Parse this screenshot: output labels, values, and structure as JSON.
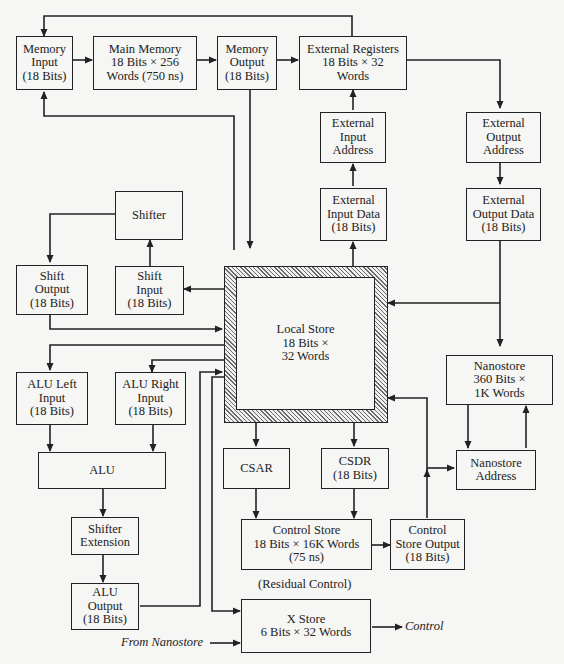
{
  "diagram": {
    "nodes": {
      "memory_input": [
        "Memory",
        "Input",
        "(18 Bits)"
      ],
      "main_memory": [
        "Main Memory",
        "18 Bits × 256",
        "Words (750 ns)"
      ],
      "memory_output": [
        "Memory",
        "Output",
        "(18 Bits)"
      ],
      "external_registers": [
        "External Registers",
        "18 Bits × 32",
        "Words"
      ],
      "external_input_address": [
        "External",
        "Input",
        "Address"
      ],
      "external_output_address": [
        "External",
        "Output",
        "Address"
      ],
      "external_input_data": [
        "External",
        "Input Data",
        "(18 Bits)"
      ],
      "external_output_data": [
        "External",
        "Output Data",
        "(18 Bits)"
      ],
      "shifter": [
        "Shifter"
      ],
      "shift_output": [
        "Shift",
        "Output",
        "(18 Bits)"
      ],
      "shift_input": [
        "Shift",
        "Input",
        "(18 Bits)"
      ],
      "local_store": [
        "Local Store",
        "18 Bits ×",
        "32 Words"
      ],
      "nanostore": [
        "Nanostore",
        "360 Bits ×",
        "1K Words"
      ],
      "nanostore_address": [
        "Nanostore",
        "Address"
      ],
      "alu_left_input": [
        "ALU Left",
        "Input",
        "(18 Bits)"
      ],
      "alu_right_input": [
        "ALU Right",
        "Input",
        "(18 Bits)"
      ],
      "alu": [
        "ALU"
      ],
      "csar": [
        "CSAR"
      ],
      "csdr": [
        "CSDR",
        "(18 Bits)"
      ],
      "shifter_extension": [
        "Shifter",
        "Extension"
      ],
      "control_store": [
        "Control Store",
        "18 Bits × 16K Words",
        "(75 ns)"
      ],
      "control_store_output": [
        "Control",
        "Store Output",
        "(18 Bits)"
      ],
      "alu_output": [
        "ALU",
        "Output",
        "(18 Bits)"
      ],
      "x_store": [
        "X Store",
        "6 Bits × 32 Words"
      ]
    },
    "labels": {
      "residual_control": "(Residual Control)",
      "from_nanostore": "From Nanostore",
      "control": "Control"
    },
    "edges": [
      [
        "memory_input",
        "main_memory"
      ],
      [
        "main_memory",
        "memory_output"
      ],
      [
        "memory_output",
        "external_registers"
      ],
      [
        "external_registers",
        "memory_input"
      ],
      [
        "memory_output",
        "local_store"
      ],
      [
        "local_store",
        "memory_input"
      ],
      [
        "external_registers",
        "external_output_address"
      ],
      [
        "external_output_address",
        "external_output_data"
      ],
      [
        "external_output_data",
        "local_store"
      ],
      [
        "external_output_data",
        "nanostore"
      ],
      [
        "external_input_address",
        "external_registers"
      ],
      [
        "external_input_data",
        "external_input_address"
      ],
      [
        "local_store",
        "external_input_data"
      ],
      [
        "shifter",
        "shift_output"
      ],
      [
        "shift_input",
        "shifter"
      ],
      [
        "local_store",
        "shift_input"
      ],
      [
        "shift_output",
        "local_store"
      ],
      [
        "local_store",
        "alu_left_input"
      ],
      [
        "local_store",
        "alu_right_input"
      ],
      [
        "alu_left_input",
        "alu"
      ],
      [
        "alu_right_input",
        "alu"
      ],
      [
        "alu",
        "shifter_extension"
      ],
      [
        "shifter_extension",
        "alu_output"
      ],
      [
        "alu_output",
        "local_store"
      ],
      [
        "local_store",
        "x_store"
      ],
      [
        "local_store",
        "csar"
      ],
      [
        "local_store",
        "csdr"
      ],
      [
        "csar",
        "control_store"
      ],
      [
        "csdr",
        "control_store"
      ],
      [
        "control_store",
        "control_store_output"
      ],
      [
        "control_store_output",
        "nanostore_address"
      ],
      [
        "control_store_output",
        "local_store"
      ],
      [
        "nanostore",
        "nanostore_address"
      ],
      [
        "nanostore_address",
        "nanostore"
      ],
      [
        "from_nanostore",
        "x_store"
      ],
      [
        "x_store",
        "control"
      ]
    ],
    "colors": {
      "ink": "#222222",
      "paper": "#f6f6f4"
    }
  }
}
